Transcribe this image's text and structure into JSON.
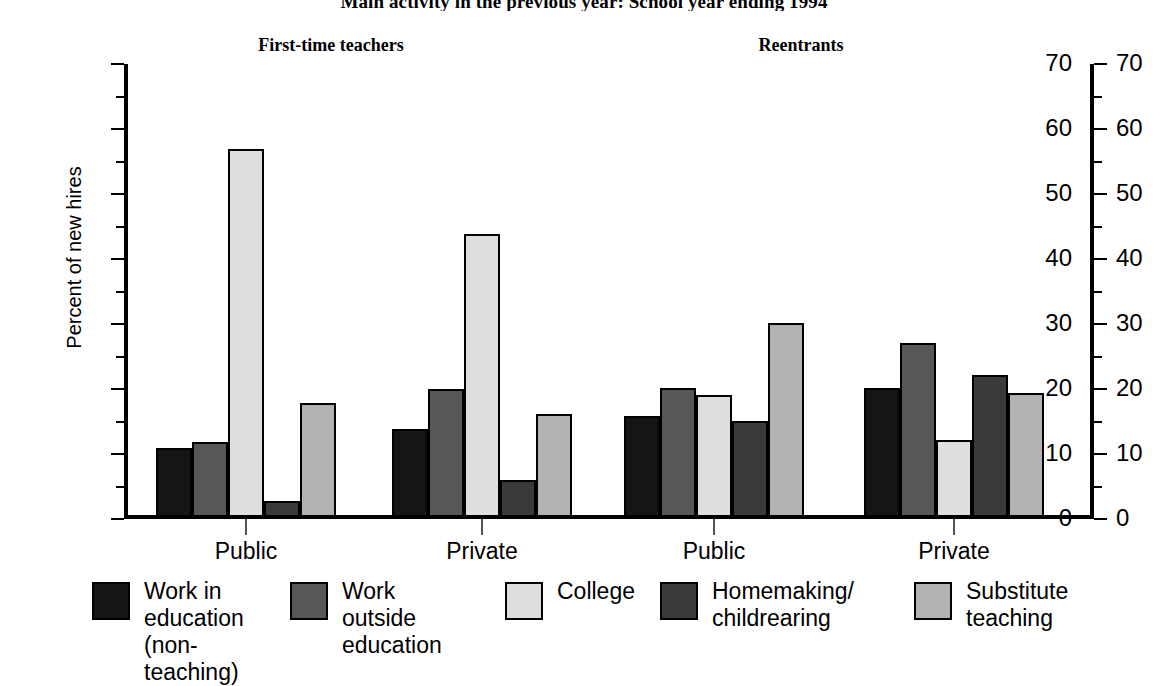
{
  "chart_data": {
    "type": "bar",
    "title": "Main activity in the previous year: School year ending 1994",
    "xlabel": "",
    "ylabel": "Percent of new hires",
    "ylim": [
      0,
      70
    ],
    "ytick_step": 10,
    "yminor_step": 5,
    "grid": false,
    "legend_position": "bottom",
    "dual_axis": true,
    "panels": [
      {
        "label": "First-time teachers"
      },
      {
        "label": "Reentrants"
      }
    ],
    "categories": [
      "Public",
      "Private",
      "Public",
      "Private"
    ],
    "ytick_labels": [
      "0",
      "10",
      "20",
      "30",
      "40",
      "50",
      "60",
      "70"
    ],
    "series": [
      {
        "name": "Work in\neducation\n(non-teaching)",
        "color": "#151515",
        "values": [
          10.3,
          13.3,
          15.3,
          19.6
        ]
      },
      {
        "name": "Work outside\neducation",
        "color": "#575757",
        "values": [
          11.2,
          19.4,
          19.5,
          26.5
        ]
      },
      {
        "name": "College",
        "color": "#dedede",
        "values": [
          56.3,
          43.3,
          18.5,
          11.5
        ]
      },
      {
        "name": "Homemaking/\nchildrearing",
        "color": "#3a3a3a",
        "values": [
          2.2,
          5.4,
          14.5,
          21.6
        ]
      },
      {
        "name": "Substitute\nteaching",
        "color": "#b2b2b2",
        "values": [
          17.3,
          15.5,
          29.5,
          18.7
        ]
      }
    ]
  },
  "colors": {
    "axis": "#000000",
    "background": "#ffffff",
    "text": "#000000"
  }
}
